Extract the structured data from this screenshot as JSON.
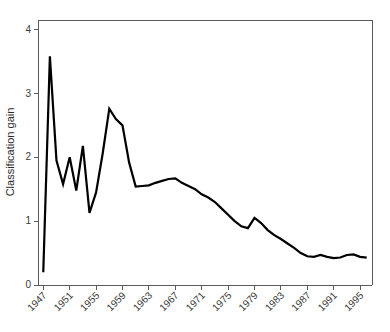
{
  "chart_data": {
    "type": "line",
    "title": "",
    "xlabel": "",
    "ylabel": "Classification gain",
    "xlim": [
      1946.2,
      1996.8
    ],
    "ylim": [
      0,
      4.15
    ],
    "grid": false,
    "legend": null,
    "line_color": "#000000",
    "axis_color": "#5a5a5a",
    "yticks": [
      0,
      1,
      2,
      3,
      4
    ],
    "ytick_labels": [
      "0",
      "1",
      "2",
      "3",
      "4"
    ],
    "xticks": [
      1947,
      1951,
      1955,
      1959,
      1963,
      1967,
      1971,
      1975,
      1979,
      1983,
      1987,
      1991,
      1995
    ],
    "xtick_labels": [
      "1947",
      "1951",
      "1955",
      "1959",
      "1963",
      "1967",
      "1971",
      "1975",
      "1979",
      "1983",
      "1987",
      "1991",
      "1995"
    ],
    "xtick_label_rotation": -45,
    "x": [
      1947,
      1948,
      1949,
      1950,
      1951,
      1952,
      1953,
      1954,
      1955,
      1956,
      1957,
      1958,
      1959,
      1960,
      1961,
      1962,
      1963,
      1964,
      1965,
      1966,
      1967,
      1968,
      1969,
      1970,
      1971,
      1972,
      1973,
      1974,
      1975,
      1976,
      1977,
      1978,
      1979,
      1980,
      1981,
      1982,
      1983,
      1984,
      1985,
      1986,
      1987,
      1988,
      1989,
      1990,
      1991,
      1992,
      1993,
      1994,
      1995,
      1996
    ],
    "y": [
      0.2,
      3.58,
      1.95,
      1.58,
      2.0,
      1.48,
      2.18,
      1.13,
      1.45,
      2.06,
      2.76,
      2.6,
      2.5,
      1.92,
      1.54,
      1.55,
      1.56,
      1.6,
      1.63,
      1.66,
      1.67,
      1.6,
      1.55,
      1.5,
      1.42,
      1.37,
      1.3,
      1.2,
      1.1,
      1.0,
      0.92,
      0.89,
      1.05,
      0.97,
      0.86,
      0.78,
      0.72,
      0.65,
      0.58,
      0.5,
      0.45,
      0.44,
      0.47,
      0.44,
      0.42,
      0.43,
      0.47,
      0.48,
      0.44,
      0.43
    ]
  }
}
